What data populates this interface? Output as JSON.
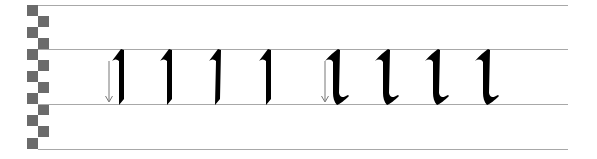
{
  "sheet": {
    "title": "Blackletter pen stroke practice: letter l",
    "guide_lines_y": [
      5,
      49,
      104,
      149
    ],
    "guide_color": "#a8a8a8",
    "ink_color": "#000000",
    "checker_color": "#6b6b6b",
    "checker_rows": 13
  },
  "groups": [
    {
      "name": "straight-stroke",
      "stroke_direction": "down",
      "letters": [
        {
          "x": 112
        },
        {
          "x": 160
        },
        {
          "x": 210
        },
        {
          "x": 259
        }
      ]
    },
    {
      "name": "hooked-stroke",
      "stroke_direction": "down",
      "letters": [
        {
          "x": 325
        },
        {
          "x": 375
        },
        {
          "x": 425
        },
        {
          "x": 475
        }
      ]
    }
  ]
}
